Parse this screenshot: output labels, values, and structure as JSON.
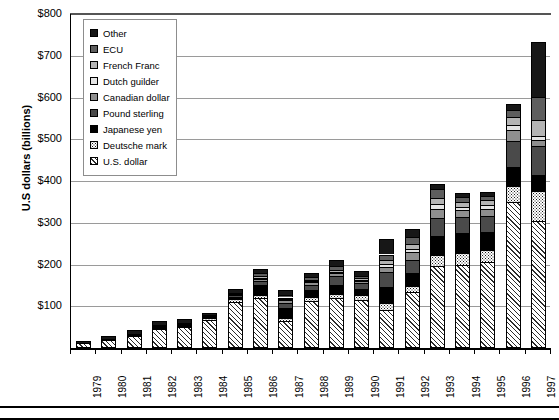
{
  "chart_data": {
    "type": "bar",
    "subtype": "stacked-bar",
    "title": "",
    "xlabel": "",
    "ylabel": "U.S dollars (billions)",
    "ylim": [
      0,
      800
    ],
    "ytick_labels": [
      "$100",
      "$200",
      "$300",
      "$400",
      "$500",
      "$600",
      "$700",
      "$800"
    ],
    "ytick_values": [
      100,
      200,
      300,
      400,
      500,
      600,
      700,
      800
    ],
    "grid": true,
    "legend_position": "upper-left-inside",
    "categories": [
      "1979",
      "1980",
      "1981",
      "1982",
      "1983",
      "1984",
      "1985",
      "1986",
      "1987",
      "1988",
      "1989",
      "1990",
      "1991",
      "1992",
      "1993",
      "1994",
      "1995",
      "1996",
      "1997"
    ],
    "series": [
      {
        "name": "U.S. dollar",
        "pattern": "diagonal-hatch",
        "color": "#ffffff",
        "values": [
          12,
          20,
          29,
          45,
          50,
          68,
          110,
          120,
          65,
          113,
          120,
          115,
          90,
          134,
          197,
          200,
          207,
          350,
          305
        ]
      },
      {
        "name": "Deutsche mark",
        "pattern": "dotted",
        "color": "#ffffff",
        "values": [
          0,
          0,
          0,
          3,
          3,
          3,
          7,
          8,
          8,
          9,
          10,
          12,
          18,
          14,
          25,
          27,
          28,
          37,
          72
        ]
      },
      {
        "name": "Japanese yen",
        "pattern": "solid",
        "color": "#000000",
        "values": [
          1,
          2,
          4,
          6,
          6,
          5,
          6,
          22,
          24,
          17,
          21,
          14,
          39,
          32,
          46,
          48,
          44,
          47,
          38
        ]
      },
      {
        "name": "Pound sterling",
        "pattern": "solid",
        "color": "#4a4a4a",
        "values": [
          0,
          0,
          0,
          0,
          0,
          1,
          3,
          10,
          12,
          13,
          21,
          14,
          35,
          31,
          44,
          38,
          37,
          62,
          70
        ]
      },
      {
        "name": "Canadian dollar",
        "pattern": "solid",
        "color": "#8f8f8f",
        "values": [
          0,
          0,
          0,
          0,
          0,
          1,
          1,
          5,
          5,
          5,
          7,
          5,
          13,
          18,
          21,
          17,
          18,
          27,
          13
        ]
      },
      {
        "name": "Dutch guilder",
        "pattern": "solid",
        "color": "#e4e4e4",
        "values": [
          0,
          0,
          0,
          0,
          0,
          0,
          1,
          3,
          3,
          3,
          4,
          3,
          7,
          9,
          11,
          8,
          8,
          12,
          9
        ]
      },
      {
        "name": "French Franc",
        "pattern": "solid",
        "color": "#b4b4b4",
        "values": [
          0,
          0,
          0,
          0,
          0,
          0,
          1,
          4,
          4,
          4,
          5,
          4,
          9,
          12,
          15,
          12,
          12,
          18,
          39
        ]
      },
      {
        "name": "ECU",
        "pattern": "solid",
        "color": "#5e5e5e",
        "values": [
          0,
          0,
          0,
          0,
          0,
          0,
          2,
          7,
          7,
          6,
          8,
          6,
          13,
          17,
          21,
          12,
          10,
          16,
          55
        ]
      },
      {
        "name": "Other",
        "pattern": "solid",
        "color": "#171717",
        "values": [
          5,
          7,
          9,
          11,
          11,
          7,
          10,
          11,
          12,
          10,
          15,
          12,
          36,
          18,
          14,
          9,
          9,
          15,
          132
        ]
      }
    ],
    "totals": [
      18,
      29,
      42,
      65,
      70,
      85,
      141,
      190,
      140,
      180,
      211,
      185,
      260,
      285,
      394,
      371,
      373,
      584,
      733
    ]
  },
  "legend": {
    "items": [
      {
        "label": "Other",
        "swatch": "swatch-other"
      },
      {
        "label": "ECU",
        "swatch": "swatch-ecu"
      },
      {
        "label": "French Franc",
        "swatch": "swatch-french-franc"
      },
      {
        "label": "Dutch guilder",
        "swatch": "swatch-dutch-guilder"
      },
      {
        "label": "Canadian dollar",
        "swatch": "swatch-canadian-dollar"
      },
      {
        "label": "Pound sterling",
        "swatch": "swatch-pound-sterling"
      },
      {
        "label": "Japanese yen",
        "swatch": "swatch-japanese-yen"
      },
      {
        "label": "Deutsche mark",
        "swatch": "swatch-deutsche-mark"
      },
      {
        "label": "U.S. dollar",
        "swatch": "swatch-us-dollar"
      }
    ]
  }
}
